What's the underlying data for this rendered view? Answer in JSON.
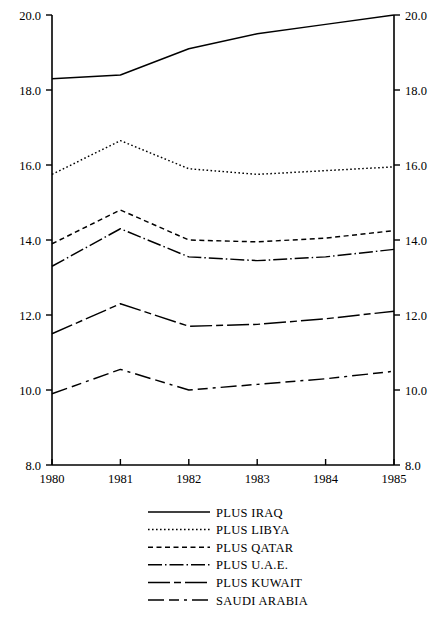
{
  "chart_data": {
    "type": "line",
    "title": "",
    "subtitle": "",
    "xlabel": "",
    "ylabel": "",
    "x": [
      1980,
      1981,
      1982,
      1983,
      1984,
      1985
    ],
    "x_tick_labels": [
      "1980",
      "1981",
      "1982",
      "1983",
      "1984",
      "1985"
    ],
    "y_tick_labels": [
      "8.0",
      "10.0",
      "12.0",
      "14.0",
      "16.0",
      "18.0",
      "20.0"
    ],
    "y_ticks": [
      8.0,
      10.0,
      12.0,
      14.0,
      16.0,
      18.0,
      20.0
    ],
    "xlim": [
      1980,
      1985
    ],
    "ylim": [
      8.0,
      20.0
    ],
    "grid": false,
    "legend_position": "bottom-center",
    "right_axis_mirrored": true,
    "right_axis_tick_labels": [
      "8.0",
      "10.0",
      "12.0",
      "14.0",
      "16.0",
      "18.0",
      "20.0"
    ],
    "series": [
      {
        "name": "PLUS IRAQ",
        "dash": "solid",
        "dasharray": "none",
        "values": [
          18.3,
          18.4,
          19.1,
          19.5,
          19.75,
          20.0
        ]
      },
      {
        "name": "PLUS LIBYA",
        "dash": "dotted",
        "dasharray": "1.6 2.4",
        "values": [
          15.75,
          16.65,
          15.9,
          15.75,
          15.85,
          15.95
        ]
      },
      {
        "name": "PLUS QATAR",
        "dash": "dashed",
        "dasharray": "5 3.5",
        "values": [
          13.9,
          14.8,
          14.0,
          13.95,
          14.05,
          14.25
        ]
      },
      {
        "name": "PLUS U.A.E.",
        "dash": "dash-dot-fine",
        "dasharray": "14 3 1.5 3",
        "values": [
          13.3,
          14.3,
          13.55,
          13.45,
          13.55,
          13.75
        ]
      },
      {
        "name": "PLUS KUWAIT",
        "dash": "long-dash-dot",
        "dasharray": "22 4 7 4",
        "values": [
          11.5,
          12.3,
          11.7,
          11.75,
          11.9,
          12.1
        ]
      },
      {
        "name": "SAUDI ARABIA",
        "dash": "long-dash-dash-dot",
        "dasharray": "16 5 10 5 3 5",
        "values": [
          9.9,
          10.55,
          10.0,
          10.15,
          10.3,
          10.5
        ]
      }
    ]
  },
  "legend": {
    "items": [
      {
        "label": "PLUS IRAQ"
      },
      {
        "label": "PLUS LIBYA"
      },
      {
        "label": "PLUS QATAR"
      },
      {
        "label": "PLUS U.A.E."
      },
      {
        "label": "PLUS KUWAIT"
      },
      {
        "label": "SAUDI ARABIA"
      }
    ]
  },
  "colors": {
    "ink": "#000000",
    "background": "#ffffff"
  }
}
